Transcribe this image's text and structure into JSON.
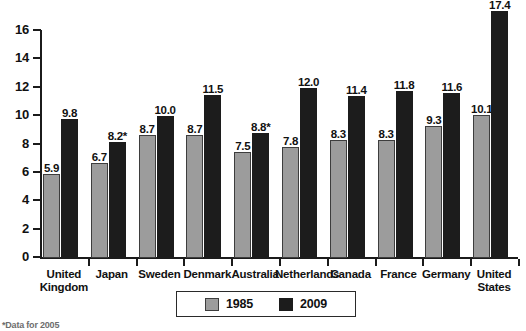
{
  "chart_data": {
    "type": "bar",
    "title": "",
    "xlabel": "",
    "ylabel": "",
    "ylim": [
      0,
      16
    ],
    "ytick_labels": [
      "0",
      "2",
      "4",
      "6",
      "8",
      "10",
      "12",
      "14",
      "16"
    ],
    "ytick_values": [
      0,
      2,
      4,
      6,
      8,
      10,
      12,
      14,
      16
    ],
    "grid": false,
    "legend_position": "bottom-center",
    "categories": [
      "United Kingdom",
      "Japan",
      "Sweden",
      "Denmark",
      "Australia",
      "Netherlands",
      "Canada",
      "France",
      "Germany",
      "United States"
    ],
    "series": [
      {
        "name": "1985",
        "color": "#9c9c9c",
        "values": [
          5.9,
          6.7,
          8.7,
          8.7,
          7.5,
          7.8,
          8.3,
          8.3,
          9.3,
          10.1
        ],
        "labels": [
          "5.9",
          "6.7",
          "8.7",
          "8.7",
          "7.5",
          "7.8",
          "8.3",
          "8.3",
          "9.3",
          "10.1"
        ]
      },
      {
        "name": "2009",
        "color": "#1c1c1c",
        "values": [
          9.8,
          8.2,
          10.0,
          11.5,
          8.8,
          12.0,
          11.4,
          11.8,
          11.6,
          17.4
        ],
        "labels": [
          "9.8",
          "8.2*",
          "10.0",
          "11.5",
          "8.8*",
          "12.0",
          "11.4",
          "11.8",
          "11.6",
          "17.4"
        ]
      }
    ],
    "annotations": [
      "*Data for 2005"
    ]
  },
  "legend": {
    "items": [
      {
        "label": "1985",
        "swatch": "gray-swatch"
      },
      {
        "label": "2009",
        "swatch": "black-swatch"
      }
    ]
  },
  "footnote": {
    "text": "*Data for 2005"
  }
}
